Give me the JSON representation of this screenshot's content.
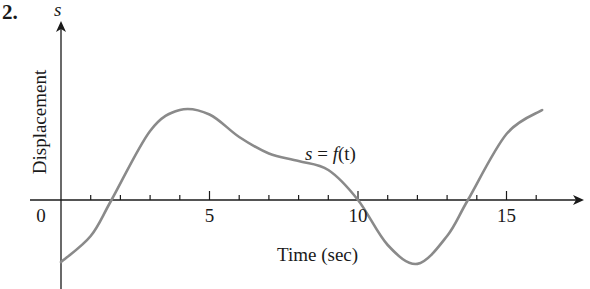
{
  "problem": {
    "number": "2."
  },
  "labels": {
    "y_variable": "s",
    "y_axis": "Displacement",
    "x_axis": "Time (sec)",
    "function_s": "s",
    "function_eq": " = ",
    "function_f": "f",
    "function_t": "(t)"
  },
  "x_ticks": [
    {
      "value": 0,
      "label": "0"
    },
    {
      "value": 5,
      "label": "5"
    },
    {
      "value": 10,
      "label": "10"
    },
    {
      "value": 15,
      "label": "15"
    }
  ],
  "colors": {
    "curve": "#8a8a8a",
    "axis": "#1a1a1a"
  },
  "chart_data": {
    "type": "line",
    "title": "",
    "annotation": "s = f(t)",
    "xlabel": "Time (sec)",
    "ylabel": "Displacement",
    "xlim": [
      -1,
      17.5
    ],
    "ylim": [
      -3.2,
      4.3
    ],
    "x_ticks": [
      0,
      1,
      2,
      3,
      4,
      5,
      6,
      7,
      8,
      9,
      10,
      11,
      12,
      13,
      14,
      15,
      16
    ],
    "x_tick_labels": [
      "0",
      "5",
      "10",
      "15"
    ],
    "y_ticks": [],
    "grid": false,
    "legend": null,
    "series": [
      {
        "name": "s = f(t)",
        "x": [
          0,
          1,
          1.7,
          3,
          4,
          5,
          6,
          7,
          8,
          9,
          10,
          11,
          12,
          13,
          13.7,
          15,
          16.2
        ],
        "values": [
          -2.07,
          -1.2,
          0,
          2.3,
          3.0,
          2.85,
          2.1,
          1.55,
          1.3,
          1.0,
          0,
          -1.5,
          -2.13,
          -1.2,
          0,
          2.2,
          3.0
        ]
      }
    ]
  }
}
